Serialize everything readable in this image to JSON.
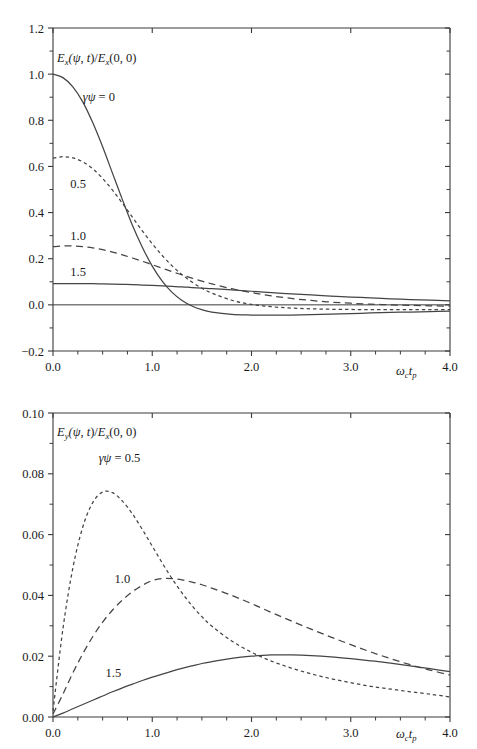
{
  "figure": {
    "background": "#ffffff",
    "ink_color": "#3a3a3a",
    "curve_color": "#444444"
  },
  "chart_data": [
    {
      "type": "line",
      "panel": "top",
      "title": "",
      "subtitle": "",
      "xlabel": "ωc tp",
      "ylabel": "Ex(ψ, t)/Ex(0, 0)",
      "ylabel_parts": {
        "e": "E",
        "e_sub": "x",
        "open": "(",
        "psi": "ψ",
        "comma": ", ",
        "t": "t",
        "close_slash": ")/",
        "e2": "E",
        "e2_sub": "x",
        "args": "(0, 0)"
      },
      "xlim": [
        0.0,
        4.0
      ],
      "ylim": [
        -0.2,
        1.2
      ],
      "xticks": [
        0.0,
        1.0,
        2.0,
        3.0,
        4.0
      ],
      "xticklabels": [
        "0.0",
        "1.0",
        "2.0",
        "3.0",
        "4.0"
      ],
      "xminorstep": 0.25,
      "yticks": [
        -0.2,
        0.0,
        0.2,
        0.4,
        0.6,
        0.8,
        1.0,
        1.2
      ],
      "yticklabels": [
        "−0.2",
        "0.0",
        "0.2",
        "0.4",
        "0.6",
        "0.8",
        "1.0",
        "1.2"
      ],
      "yminorstep": 0.1,
      "grid": false,
      "legend_position": "inline-annotations",
      "zero_line": 0.0,
      "x": [
        0.0,
        0.1,
        0.2,
        0.3,
        0.4,
        0.5,
        0.6,
        0.7,
        0.8,
        0.9,
        1.0,
        1.1,
        1.2,
        1.3,
        1.4,
        1.5,
        1.6,
        1.8,
        2.0,
        2.2,
        2.4,
        2.6,
        2.8,
        3.0,
        3.2,
        3.4,
        3.6,
        3.8,
        4.0
      ],
      "series": [
        {
          "name": "γψ = 0",
          "label": "γψ = 0",
          "style": "solid",
          "label_x": 0.3,
          "label_y": 0.905,
          "values": [
            1.0,
            0.985,
            0.945,
            0.88,
            0.79,
            0.685,
            0.57,
            0.455,
            0.345,
            0.25,
            0.168,
            0.103,
            0.054,
            0.019,
            -0.005,
            -0.021,
            -0.031,
            -0.041,
            -0.044,
            -0.045,
            -0.044,
            -0.042,
            -0.04,
            -0.038,
            -0.035,
            -0.033,
            -0.031,
            -0.029,
            -0.027
          ]
        },
        {
          "name": "0.5",
          "label": "0.5",
          "style": "dotted",
          "label_x": 0.175,
          "label_y": 0.525,
          "values": [
            0.636,
            0.642,
            0.637,
            0.62,
            0.59,
            0.548,
            0.497,
            0.44,
            0.38,
            0.321,
            0.265,
            0.214,
            0.169,
            0.131,
            0.099,
            0.072,
            0.051,
            0.02,
            0.002,
            -0.008,
            -0.014,
            -0.017,
            -0.019,
            -0.02,
            -0.021,
            -0.021,
            -0.021,
            -0.021,
            -0.021
          ]
        },
        {
          "name": "1.0",
          "label": "1.0",
          "style": "dashed",
          "label_x": 0.175,
          "label_y": 0.3,
          "values": [
            0.252,
            0.255,
            0.255,
            0.252,
            0.247,
            0.239,
            0.229,
            0.217,
            0.203,
            0.189,
            0.174,
            0.159,
            0.144,
            0.13,
            0.116,
            0.103,
            0.091,
            0.07,
            0.053,
            0.039,
            0.028,
            0.019,
            0.012,
            0.007,
            0.003,
            0.0,
            -0.002,
            -0.004,
            -0.006
          ]
        },
        {
          "name": "1.5",
          "label": "1.5",
          "style": "solid",
          "label_x": 0.175,
          "label_y": 0.145,
          "values": [
            0.092,
            0.092,
            0.092,
            0.092,
            0.092,
            0.091,
            0.09,
            0.089,
            0.088,
            0.086,
            0.084,
            0.082,
            0.08,
            0.078,
            0.075,
            0.073,
            0.07,
            0.065,
            0.059,
            0.053,
            0.048,
            0.043,
            0.038,
            0.034,
            0.03,
            0.026,
            0.023,
            0.02,
            0.017
          ]
        }
      ]
    },
    {
      "type": "line",
      "panel": "bottom",
      "title": "",
      "subtitle": "",
      "xlabel": "ωc tp",
      "ylabel": "Ey(ψ, t)/Ex(0, 0)",
      "ylabel_parts": {
        "e": "E",
        "e_sub": "y",
        "open": "(",
        "psi": "ψ",
        "comma": ", ",
        "t": "t",
        "close_slash": ")/",
        "e2": "E",
        "e2_sub": "x",
        "args": "(0, 0)"
      },
      "xlim": [
        0.0,
        4.0
      ],
      "ylim": [
        0.0,
        0.1
      ],
      "xticks": [
        0.0,
        1.0,
        2.0,
        3.0,
        4.0
      ],
      "xticklabels": [
        "0.0",
        "1.0",
        "2.0",
        "3.0",
        "4.0"
      ],
      "xminorstep": 0.25,
      "yticks": [
        0.0,
        0.02,
        0.04,
        0.06,
        0.08,
        0.1
      ],
      "yticklabels": [
        "0.00",
        "0.02",
        "0.04",
        "0.06",
        "0.08",
        "0.10"
      ],
      "yminorstep": 0.01,
      "grid": false,
      "legend_position": "inline-annotations",
      "x": [
        0.0,
        0.1,
        0.2,
        0.3,
        0.4,
        0.5,
        0.6,
        0.7,
        0.8,
        0.9,
        1.0,
        1.1,
        1.2,
        1.3,
        1.4,
        1.5,
        1.6,
        1.8,
        2.0,
        2.2,
        2.4,
        2.6,
        2.8,
        3.0,
        3.2,
        3.4,
        3.6,
        3.8,
        4.0
      ],
      "series": [
        {
          "name": "γψ = 0.5",
          "label": "γψ = 0.5",
          "style": "dotted",
          "label_x": 0.46,
          "label_y": 0.0855,
          "values": [
            0.002,
            0.029,
            0.049,
            0.0625,
            0.0705,
            0.074,
            0.0738,
            0.071,
            0.0668,
            0.0617,
            0.0562,
            0.0507,
            0.0455,
            0.0408,
            0.0366,
            0.033,
            0.0299,
            0.025,
            0.0213,
            0.0184,
            0.0161,
            0.0142,
            0.0126,
            0.0113,
            0.0101,
            0.0092,
            0.0083,
            0.0075,
            0.0066
          ]
        },
        {
          "name": "1.0",
          "label": "1.0",
          "style": "dashed",
          "label_x": 0.62,
          "label_y": 0.0455,
          "values": [
            0.001,
            0.0075,
            0.0145,
            0.0208,
            0.0264,
            0.0312,
            0.0352,
            0.0385,
            0.0412,
            0.0433,
            0.0449,
            0.0455,
            0.0455,
            0.0451,
            0.0444,
            0.0435,
            0.0424,
            0.04,
            0.0373,
            0.0344,
            0.0316,
            0.0289,
            0.0263,
            0.0238,
            0.0214,
            0.0192,
            0.0172,
            0.0154,
            0.0138
          ]
        },
        {
          "name": "1.5",
          "label": "1.5",
          "style": "solid",
          "label_x": 0.53,
          "label_y": 0.0148,
          "values": [
            0.0,
            0.0013,
            0.0027,
            0.0041,
            0.0055,
            0.0069,
            0.0083,
            0.0096,
            0.0108,
            0.012,
            0.0131,
            0.0141,
            0.0151,
            0.016,
            0.0168,
            0.0176,
            0.0182,
            0.0193,
            0.02,
            0.0204,
            0.0204,
            0.0202,
            0.0198,
            0.0192,
            0.0185,
            0.0177,
            0.0168,
            0.0159,
            0.0149
          ]
        }
      ]
    }
  ]
}
